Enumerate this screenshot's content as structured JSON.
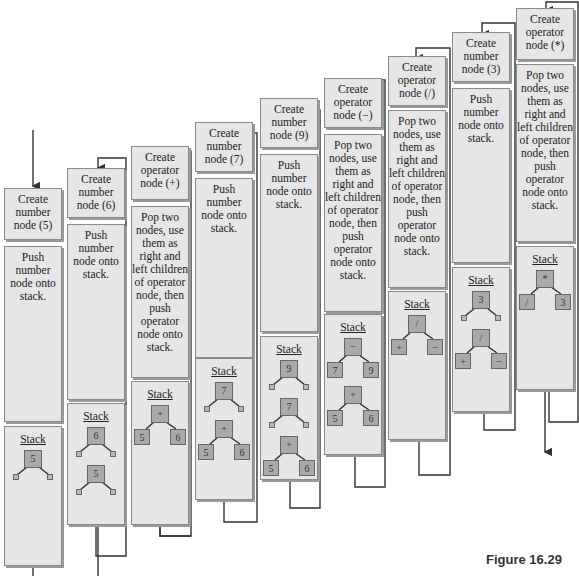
{
  "figure": {
    "caption": "Figure 16.29"
  },
  "steps": [
    {
      "create": "Create number node (5)",
      "action": "Push number node onto stack.",
      "stack_title": "Stack",
      "stack": [
        {
          "root": "5",
          "left": "",
          "right": ""
        }
      ]
    },
    {
      "create": "Create number node (6)",
      "action": "Push number node onto stack.",
      "stack_title": "Stack",
      "stack": [
        {
          "root": "6",
          "left": "",
          "right": ""
        },
        {
          "root": "5",
          "left": "",
          "right": ""
        }
      ]
    },
    {
      "create": "Create operator node (+)",
      "action": "Pop two nodes, use them as right and left children of operator node, then push operator node onto stack.",
      "stack_title": "Stack",
      "stack": [
        {
          "root": "+",
          "left": "5",
          "right": "6"
        }
      ]
    },
    {
      "create": "Create number node (7)",
      "action": "Push number node onto stack.",
      "stack_title": "Stack",
      "stack": [
        {
          "root": "7",
          "left": "",
          "right": ""
        },
        {
          "root": "+",
          "left": "5",
          "right": "6"
        }
      ]
    },
    {
      "create": "Create number node (9)",
      "action": "Push number node onto stack.",
      "stack_title": "Stack",
      "stack": [
        {
          "root": "9",
          "left": "",
          "right": ""
        },
        {
          "root": "7",
          "left": "",
          "right": ""
        },
        {
          "root": "+",
          "left": "5",
          "right": "6"
        }
      ]
    },
    {
      "create": "Create operator node (−)",
      "action": "Pop two nodes, use them as right and left children of operator node, then push operator node onto stack.",
      "stack_title": "Stack",
      "stack": [
        {
          "root": "−",
          "left": "7",
          "right": "9"
        },
        {
          "root": "+",
          "left": "5",
          "right": "6"
        }
      ]
    },
    {
      "create": "Create operator node (/)",
      "action": "Pop two nodes, use them as right and left children of operator node, then push operator node onto stack.",
      "stack_title": "Stack",
      "stack": [
        {
          "root": "/",
          "left": "+",
          "right": "−"
        }
      ]
    },
    {
      "create": "Create number node (3)",
      "action": "Push number node onto stack.",
      "stack_title": "Stack",
      "stack": [
        {
          "root": "3",
          "left": "",
          "right": ""
        },
        {
          "root": "/",
          "left": "+",
          "right": "−"
        }
      ]
    },
    {
      "create": "Create operator node (*)",
      "action": "Pop two nodes, use them as right and left children of operator node, then push operator node onto stack.",
      "stack_title": "Stack",
      "stack": [
        {
          "root": "*",
          "left": "/",
          "right": "3"
        }
      ]
    }
  ],
  "colors": {
    "box_fill": "#e6e6e6",
    "node_fill": "#a9a9a9",
    "line": "#333333"
  }
}
